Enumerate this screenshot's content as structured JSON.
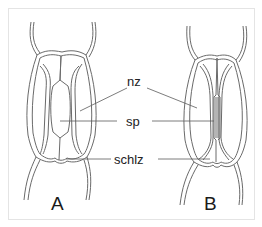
{
  "diagram": {
    "title": "",
    "panels": [
      {
        "id": "A",
        "label": "A"
      },
      {
        "id": "B",
        "label": "B"
      }
    ],
    "labels": [
      {
        "id": "nz",
        "text": "nz"
      },
      {
        "id": "sp",
        "text": "sp"
      },
      {
        "id": "schlz",
        "text": "schlz"
      }
    ],
    "colors": {
      "line": "#6a6a6a",
      "text": "#222222",
      "background": "#ffffff",
      "frame": "#e4e4e4"
    }
  }
}
